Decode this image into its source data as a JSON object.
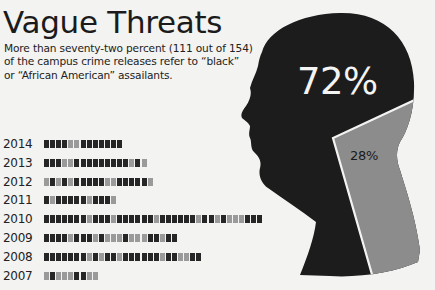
{
  "header": {
    "title": "Vague Threats",
    "subtitle_lines": [
      "More than seventy-two percent (111 out of 154)",
      "of the campus crime releases refer to “black”",
      "or “African American” assailants."
    ]
  },
  "colors": {
    "black_reference": "#262626",
    "other_reference": "#9a9a9a",
    "head_dark": "#1c1c1c",
    "wedge_gray": "#8c8c8c",
    "background": "#f3f3f1"
  },
  "pie": {
    "big_label": "72%",
    "small_label": "28%"
  },
  "chart_data": [
    {
      "type": "pie",
      "title": "Vague Threats",
      "subtitle": "More than seventy-two percent (111 out of 154) of the campus crime releases refer to “black” or “African American” assailants.",
      "shape": "head silhouette",
      "categories": [
        "Refer to “black” or “African American” assailants",
        "Other"
      ],
      "values": [
        72,
        28
      ],
      "labels": [
        "72%",
        "28%"
      ],
      "counts": [
        111,
        43
      ],
      "total": 154
    },
    {
      "type": "bar",
      "subtype": "unit/waffle rows (one square per release)",
      "categories": [
        "2014",
        "2013",
        "2012",
        "2011",
        "2010",
        "2009",
        "2008",
        "2007"
      ],
      "legend": {
        "D": "dark square (refers to black/African American)",
        "G": "gray square (other)"
      },
      "rows": [
        {
          "year": "2014",
          "squares": "DDDDGGDDDDDDD"
        },
        {
          "year": "2013",
          "squares": "DDDGGDDDDDDDDDGDG"
        },
        {
          "year": "2012",
          "squares": "GDGDGDDDDDGGDDDDDG"
        },
        {
          "year": "2011",
          "squares": "DGDDDDDGDDDG"
        },
        {
          "year": "2010",
          "squares": "DDDDDDDGDDDGDDDDDDGDDDDDDGDDGDGGGDDD"
        },
        {
          "year": "2009",
          "squares": "DDDDGDDDGDGGGDGGGDDGDD"
        },
        {
          "year": "2008",
          "squares": "DDDDDDDGDGDDGDDDDDDGDDGGDD"
        },
        {
          "year": "2007",
          "squares": "GDGGGDDGG"
        }
      ],
      "values": [
        13,
        17,
        18,
        12,
        36,
        22,
        26,
        9
      ]
    }
  ]
}
